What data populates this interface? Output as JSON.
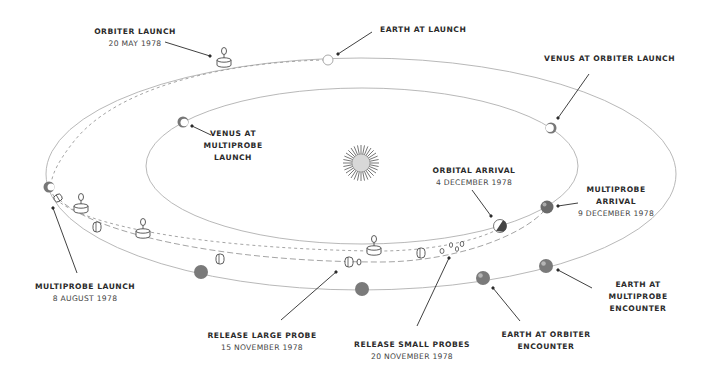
{
  "diagram": {
    "colors": {
      "orbit": "#aaaaaa",
      "trajectory": "#999999",
      "planet_fill": "#7a7a7a",
      "leader": "#2b2b2b",
      "text": "#2b2b2b",
      "sun_rays": "#666666",
      "sun_core": "#d8d8d8"
    },
    "labels": {
      "orbiter_launch": {
        "title": "ORBITER LAUNCH",
        "date": "20 MAY 1978"
      },
      "earth_at_launch": {
        "title": "EARTH AT LAUNCH"
      },
      "venus_at_orbiter_launch": {
        "title": "VENUS AT ORBITER LAUNCH"
      },
      "venus_at_multiprobe_launch": {
        "line1": "VENUS AT",
        "line2": "MULTIPROBE",
        "line3": "LAUNCH"
      },
      "orbital_arrival": {
        "title": "ORBITAL ARRIVAL",
        "date": "4 DECEMBER 1978"
      },
      "multiprobe_arrival": {
        "line1": "MULTIPROBE",
        "line2": "ARRIVAL",
        "date": "9 DECEMBER 1978"
      },
      "multiprobe_launch": {
        "title": "MULTIPROBE LAUNCH",
        "date": "8 AUGUST 1978"
      },
      "release_large_probe": {
        "title": "RELEASE LARGE PROBE",
        "date": "15 NOVEMBER 1978"
      },
      "release_small_probes": {
        "title": "RELEASE SMALL PROBES",
        "date": "20 NOVEMBER 1978"
      },
      "earth_at_orbiter_encounter": {
        "line1": "EARTH AT ORBITER",
        "line2": "ENCOUNTER"
      },
      "earth_at_multiprobe_encounter": {
        "line1": "EARTH AT",
        "line2": "MULTIPROBE",
        "line3": "ENCOUNTER"
      }
    },
    "icons": {
      "sun": "sun-icon",
      "earth": "earth-icon",
      "venus": "venus-icon",
      "orbiter": "orbiter-spacecraft-icon",
      "multiprobe_bus": "multiprobe-bus-icon",
      "large_probe": "large-probe-icon",
      "small_probe": "small-probe-icon"
    }
  }
}
